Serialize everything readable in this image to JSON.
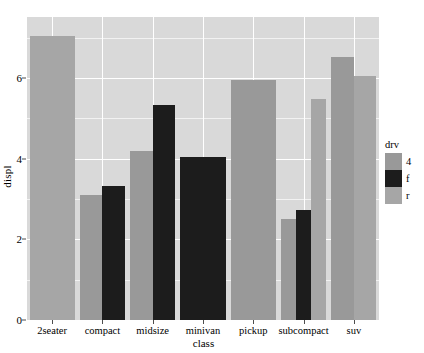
{
  "chart_data": {
    "type": "bar",
    "title": "",
    "xlabel": "class",
    "ylabel": "displ",
    "categories": [
      "2seater",
      "compact",
      "midsize",
      "minivan",
      "pickup",
      "subcompact",
      "suv"
    ],
    "series": [
      {
        "name": "4",
        "color": "#999999",
        "values": [
          null,
          3.1,
          4.2,
          null,
          5.96,
          2.5,
          6.53
        ]
      },
      {
        "name": "f",
        "color": "#1c1c1c",
        "values": [
          null,
          3.33,
          5.33,
          4.05,
          null,
          2.73,
          null
        ]
      },
      {
        "name": "r",
        "color": "#a6a6a6",
        "values": [
          7.04,
          null,
          null,
          null,
          null,
          5.47,
          6.05
        ]
      }
    ],
    "legend": {
      "title": "drv",
      "position": "right",
      "entries": [
        {
          "label": "4",
          "color": "#999999"
        },
        {
          "label": "f",
          "color": "#1c1c1c"
        },
        {
          "label": "r",
          "color": "#a6a6a6"
        }
      ]
    },
    "yticks": [
      0,
      2,
      4,
      6
    ],
    "ytick_labels": [
      "0",
      "2",
      "4",
      "6"
    ],
    "ylim": [
      0,
      7.51
    ],
    "grid": true,
    "panel_background": "#d9d9d9",
    "gridline_major_color": "#ffffff",
    "gridline_minor_color": "#f2f2f2"
  },
  "axes": {
    "y_title": "displ",
    "x_title": "class"
  }
}
